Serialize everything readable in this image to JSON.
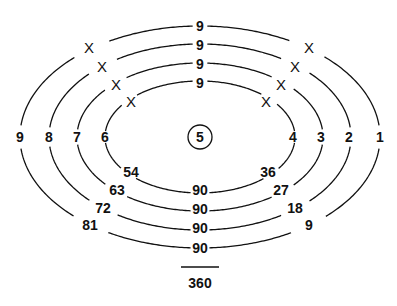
{
  "center": {
    "label": "5",
    "x": 200,
    "y": 137,
    "r": 12
  },
  "rings": [
    {
      "id": "ring-4",
      "rx": 95,
      "ry": 56,
      "top_label": "9",
      "top_y": 83,
      "bottom_label": "90",
      "bottom_y": 190,
      "left_label": "6",
      "left_x": 105,
      "right_label": "4",
      "right_x": 293,
      "left_x_mark": {
        "x": 131,
        "y": 101
      },
      "right_x_mark": {
        "x": 266,
        "y": 101
      },
      "left_bottom_label": "54",
      "left_bottom": {
        "x": 131,
        "y": 172
      },
      "right_bottom_label": "36",
      "right_bottom": {
        "x": 268,
        "y": 172
      }
    },
    {
      "id": "ring-3",
      "rx": 123,
      "ry": 74,
      "top_label": "9",
      "top_y": 64,
      "bottom_label": "90",
      "bottom_y": 209,
      "left_label": "7",
      "left_x": 77,
      "right_label": "3",
      "right_x": 321,
      "left_x_mark": {
        "x": 116,
        "y": 84
      },
      "right_x_mark": {
        "x": 281,
        "y": 84
      },
      "left_bottom_label": "63",
      "left_bottom": {
        "x": 117,
        "y": 190
      },
      "right_bottom_label": "27",
      "right_bottom": {
        "x": 281,
        "y": 190
      }
    },
    {
      "id": "ring-2",
      "rx": 151,
      "ry": 93,
      "top_label": "9",
      "top_y": 45,
      "bottom_label": "90",
      "bottom_y": 228,
      "left_label": "8",
      "left_x": 49,
      "right_label": "2",
      "right_x": 349,
      "left_x_mark": {
        "x": 102,
        "y": 66
      },
      "right_x_mark": {
        "x": 295,
        "y": 66
      },
      "left_bottom_label": "72",
      "left_bottom": {
        "x": 103,
        "y": 208
      },
      "right_bottom_label": "18",
      "right_bottom": {
        "x": 295,
        "y": 208
      }
    },
    {
      "id": "ring-1",
      "rx": 180,
      "ry": 111,
      "top_label": "9",
      "top_y": 26,
      "bottom_label": "90",
      "bottom_y": 248,
      "left_label": "9",
      "left_x": 20,
      "right_label": "1",
      "right_x": 380,
      "left_x_mark": {
        "x": 89,
        "y": 47
      },
      "right_x_mark": {
        "x": 309,
        "y": 47
      },
      "left_bottom_label": "81",
      "left_bottom": {
        "x": 90,
        "y": 225
      },
      "right_bottom_label": "9",
      "right_bottom": {
        "x": 309,
        "y": 225
      }
    }
  ],
  "x_mark_label": "X",
  "sum_line": {
    "x1": 181,
    "x2": 219,
    "y": 267
  },
  "total": {
    "label": "360",
    "x": 200,
    "y": 283
  }
}
